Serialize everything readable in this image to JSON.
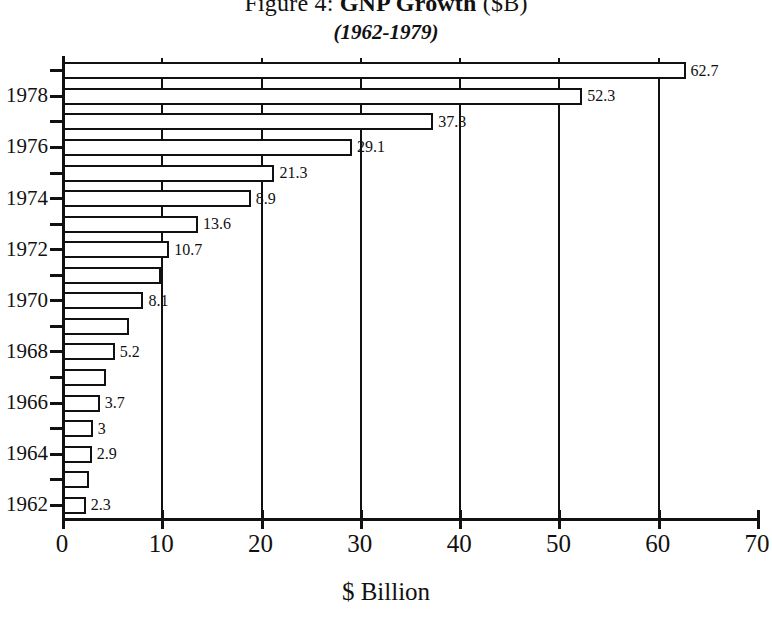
{
  "chart_data": {
    "type": "bar",
    "orientation": "horizontal",
    "title_prefix": "Figure 4:",
    "title_main": "GNP Growth",
    "title_suffix": "($B)",
    "subtitle": "(1962-1979)",
    "xlabel": "$ Billion",
    "ylabel": "",
    "xlim": [
      0,
      70
    ],
    "xticks": [
      0,
      10,
      20,
      30,
      40,
      50,
      60,
      70
    ],
    "xtick_labels": [
      "0",
      "10",
      "20",
      "30",
      "40",
      "50",
      "60",
      "70"
    ],
    "grid": true,
    "grid_axis": "x",
    "legend": "none",
    "bar_facecolor": "#ffffff",
    "bar_edgecolor": "#111111",
    "categories": [
      "1962",
      "1963",
      "1964",
      "1965",
      "1966",
      "1967",
      "1968",
      "1969",
      "1970",
      "1971",
      "1972",
      "1973",
      "1974",
      "1975",
      "1976",
      "1977",
      "1978",
      "1979"
    ],
    "values": [
      2.3,
      2.6,
      2.9,
      3,
      3.7,
      4.3,
      5.2,
      6.6,
      8.1,
      9.9,
      10.7,
      13.6,
      18.9,
      21.3,
      29.1,
      37.3,
      52.3,
      62.7
    ],
    "point_labels": [
      "2.3",
      "",
      "2.9",
      "3",
      "3.7",
      "",
      "5.2",
      "",
      "8.1",
      "",
      "10.7",
      "13.6",
      "8.9",
      "21.3",
      "29.1",
      "37.3",
      "52.3",
      "62.7"
    ],
    "ytick_labels_shown": [
      "1962",
      "1964",
      "1966",
      "1968",
      "1970",
      "1972",
      "1974",
      "1976",
      "1978"
    ]
  }
}
